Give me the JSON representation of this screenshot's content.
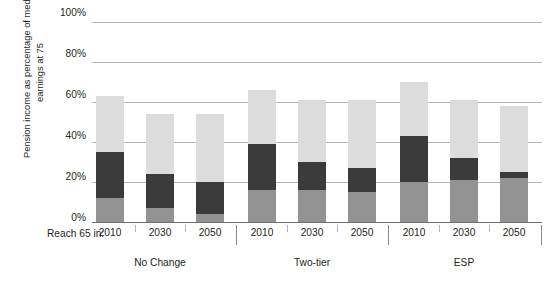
{
  "chart_data": {
    "type": "bar",
    "subtype": "stacked-bar-grouped",
    "title": "",
    "xlabel": "Reach 65 in:",
    "ylabel": "Pension income as percentage of median earnings at 75",
    "ylim": [
      0,
      100
    ],
    "ytick_labels": [
      "0%",
      "20%",
      "40%",
      "60%",
      "80%",
      "100%"
    ],
    "ytick_values": [
      0,
      20,
      40,
      60,
      80,
      100
    ],
    "grid": true,
    "legend_position": "none",
    "categories": [
      "2010",
      "2030",
      "2050",
      "2010",
      "2030",
      "2050",
      "2010",
      "2030",
      "2050"
    ],
    "groups": [
      {
        "label": "No Change",
        "years": [
          "2010",
          "2030",
          "2050"
        ]
      },
      {
        "label": "Two-tier",
        "years": [
          "2010",
          "2030",
          "2050"
        ]
      },
      {
        "label": "ESP",
        "years": [
          "2010",
          "2030",
          "2050"
        ]
      }
    ],
    "series": [
      {
        "name": "bottom-segment",
        "color": "#939393",
        "values": [
          12,
          7,
          4,
          16,
          16,
          15,
          20,
          21,
          22
        ]
      },
      {
        "name": "middle-segment",
        "color": "#3b3b3b",
        "values": [
          23,
          17,
          16,
          23,
          14,
          12,
          23,
          11,
          3
        ]
      },
      {
        "name": "top-segment",
        "color": "#dcdcdc",
        "values": [
          28,
          30,
          34,
          27,
          31,
          34,
          27,
          29,
          33
        ]
      }
    ],
    "totals": [
      63,
      54,
      54,
      66,
      61,
      61,
      70,
      61,
      58
    ],
    "colors": {
      "bottom": "#939393",
      "middle": "#3b3b3b",
      "top": "#dcdcdc",
      "grid": "#b7b7b7",
      "axis": "#6d6d6d",
      "text": "#231f20"
    }
  }
}
